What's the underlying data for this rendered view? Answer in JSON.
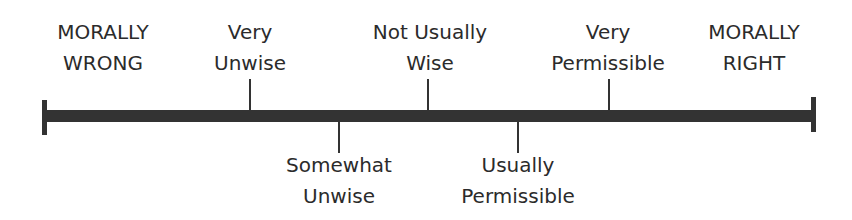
{
  "scale": {
    "left_end": {
      "label": "MORALLY\nWRONG"
    },
    "right_end": {
      "label": "MORALLY\nRIGHT"
    },
    "points": [
      {
        "label": "Very\nUnwise",
        "position": "above"
      },
      {
        "label": "Somewhat\nUnwise",
        "position": "below"
      },
      {
        "label": "Not Usually\nWise",
        "position": "above"
      },
      {
        "label": "Usually\nPermissible",
        "position": "below"
      },
      {
        "label": "Very\nPermissible",
        "position": "above"
      }
    ]
  },
  "colors": {
    "line": "#333333",
    "text": "#2b2b2b"
  }
}
